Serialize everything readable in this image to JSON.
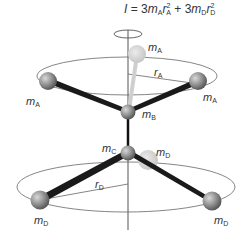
{
  "formula": {
    "lhs": "I",
    "eq": " = 3",
    "term1_m": "m",
    "term1_m_sub": "A",
    "term1_r": "r",
    "term1_r_sub": "A",
    "term1_r_sup": "2",
    "plus": " + 3",
    "term2_m": "m",
    "term2_m_sub": "D",
    "term2_r": "r",
    "term2_r_sub": "D",
    "term2_r_sup": "2"
  },
  "labels": {
    "mA_top": {
      "base": "m",
      "sub": "A"
    },
    "rA": {
      "base": "r",
      "sub": "A"
    },
    "mA_left": {
      "base": "m",
      "sub": "A"
    },
    "mA_right": {
      "base": "m",
      "sub": "A"
    },
    "mB": {
      "base": "m",
      "sub": "B"
    },
    "mC": {
      "base": "m",
      "sub": "C"
    },
    "mD_back": {
      "base": "m",
      "sub": "D"
    },
    "rD": {
      "base": "r",
      "sub": "D"
    },
    "mD_left": {
      "base": "m",
      "sub": "D"
    },
    "mD_right": {
      "base": "m",
      "sub": "D"
    }
  },
  "colors": {
    "line": "#555555",
    "bond": "#1a1a1a",
    "atom": "#8a8a8a",
    "atom_ghost": "#d0d0d0"
  }
}
